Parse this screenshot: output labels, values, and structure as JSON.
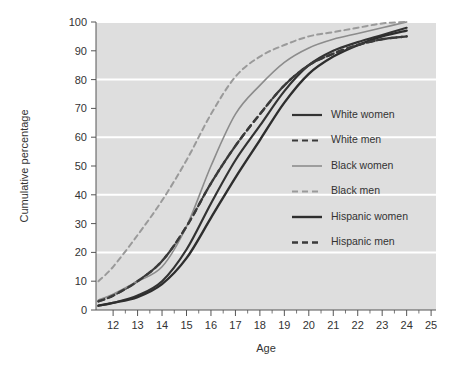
{
  "chart_data": {
    "type": "line",
    "title": "",
    "xlabel": "Age",
    "ylabel": "Cumulative percentage",
    "xlim": [
      11.3,
      25.2
    ],
    "ylim": [
      0,
      100
    ],
    "xticks": [
      12,
      13,
      14,
      15,
      16,
      17,
      18,
      19,
      20,
      21,
      22,
      23,
      24,
      25
    ],
    "yticks": [
      0,
      10,
      20,
      30,
      40,
      50,
      60,
      70,
      80,
      90,
      100
    ],
    "gridlines_y": [
      20,
      40,
      60,
      80,
      100
    ],
    "grid": true,
    "grid_color": "#ffffff",
    "plot_bg": "#dedede",
    "legend_position": "center-right",
    "x": [
      11.4,
      12,
      13,
      14,
      15,
      16,
      17,
      18,
      19,
      20,
      21,
      22,
      23,
      24
    ],
    "series": [
      {
        "name": "White women",
        "color": "#333333",
        "style": "solid",
        "width": 2.2,
        "values": [
          1.5,
          2.5,
          5,
          10,
          21,
          37,
          52,
          64,
          76,
          85,
          90,
          93,
          95.5,
          98
        ]
      },
      {
        "name": "White men",
        "color": "#3a3a3a",
        "style": "dashed",
        "width": 2.2,
        "values": [
          3,
          5,
          10,
          17,
          29,
          44,
          57,
          68,
          78,
          85,
          89,
          92,
          94,
          95
        ]
      },
      {
        "name": "Black women",
        "color": "#8c8c8c",
        "style": "solid",
        "width": 1.6,
        "values": [
          3.5,
          5.5,
          10,
          15,
          29,
          50,
          68,
          78,
          86,
          91,
          94,
          96,
          98,
          100
        ]
      },
      {
        "name": "Black men",
        "color": "#9a9a9a",
        "style": "dashed",
        "width": 2.0,
        "values": [
          10,
          15,
          26,
          38,
          52,
          68,
          81,
          88,
          92,
          95,
          96.5,
          98,
          99.5,
          100
        ]
      },
      {
        "name": "Hispanic women",
        "color": "#2e2e2e",
        "style": "solid",
        "width": 2.4,
        "values": [
          1.5,
          2.5,
          4.5,
          9,
          18,
          32,
          46,
          59,
          72,
          82,
          88,
          92,
          95,
          97
        ]
      },
      {
        "name": "Hispanic men",
        "color": "#3a3a3a",
        "style": "dashed",
        "width": 2.4,
        "values": [
          3,
          5,
          10,
          17,
          29,
          44,
          57,
          68,
          78,
          85,
          89,
          92,
          94,
          95
        ]
      }
    ],
    "legend": [
      {
        "label": "White women",
        "color": "#333333",
        "style": "solid",
        "width": 2.2
      },
      {
        "label": "White men",
        "color": "#3a3a3a",
        "style": "dashed",
        "width": 2.2
      },
      {
        "label": "Black women",
        "color": "#8c8c8c",
        "style": "solid",
        "width": 1.6
      },
      {
        "label": "Black men",
        "color": "#9a9a9a",
        "style": "dashed",
        "width": 2.0
      },
      {
        "label": "Hispanic women",
        "color": "#2e2e2e",
        "style": "solid",
        "width": 2.4
      },
      {
        "label": "Hispanic men",
        "color": "#3a3a3a",
        "style": "dashed",
        "width": 2.4
      }
    ]
  }
}
